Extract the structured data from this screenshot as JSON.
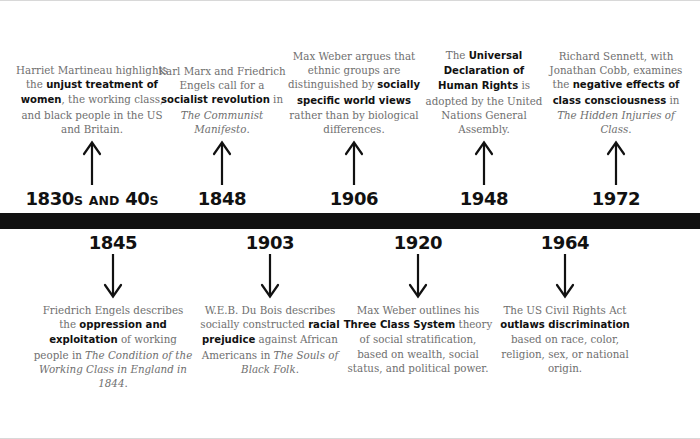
{
  "graphic": {
    "title": "Sociology timeline of class, race and rights",
    "bar_color": "#111111",
    "body_text_color": "#6f6f6f",
    "highlight_text_color": "#111111"
  },
  "top_events": [
    {
      "year": "1830s and 40s",
      "year_main": "1830",
      "arrow": "arrow-up-icon",
      "text_segments": [
        {
          "t": "Harriet Martineau highlights the ",
          "style": "normal"
        },
        {
          "t": "unjust treatment of women",
          "style": "bold"
        },
        {
          "t": ", the working class, and black people in the US and Britain.",
          "style": "normal"
        }
      ]
    },
    {
      "year": "1848",
      "arrow": "arrow-up-icon",
      "text_segments": [
        {
          "t": "Karl Marx and Friedrich Engels call for a ",
          "style": "normal"
        },
        {
          "t": "socialist revolution",
          "style": "bold"
        },
        {
          "t": " in ",
          "style": "normal"
        },
        {
          "t": "The Communist Manifesto",
          "style": "italic"
        },
        {
          "t": ".",
          "style": "normal"
        }
      ]
    },
    {
      "year": "1906",
      "arrow": "arrow-up-icon",
      "text_segments": [
        {
          "t": "Max Weber argues that ethnic groups are distinguished by ",
          "style": "normal"
        },
        {
          "t": "socially specific world views",
          "style": "bold"
        },
        {
          "t": " rather than by biological differences.",
          "style": "normal"
        }
      ]
    },
    {
      "year": "1948",
      "arrow": "arrow-up-icon",
      "text_segments": [
        {
          "t": "The ",
          "style": "normal"
        },
        {
          "t": "Universal Declaration of Human Rights",
          "style": "bold"
        },
        {
          "t": " is adopted by the United Nations General Assembly.",
          "style": "normal"
        }
      ]
    },
    {
      "year": "1972",
      "arrow": "arrow-up-icon",
      "text_segments": [
        {
          "t": "Richard Sennett, with Jonathan Cobb, examines the ",
          "style": "normal"
        },
        {
          "t": "negative effects of class consciousness",
          "style": "bold"
        },
        {
          "t": " in ",
          "style": "normal"
        },
        {
          "t": "The Hidden Injuries of Class",
          "style": "italic"
        },
        {
          "t": ".",
          "style": "normal"
        }
      ]
    }
  ],
  "bottom_events": [
    {
      "year": "1845",
      "arrow": "arrow-down-icon",
      "text_segments": [
        {
          "t": "Friedrich Engels describes the ",
          "style": "normal"
        },
        {
          "t": "oppression and exploitation",
          "style": "bold"
        },
        {
          "t": " of working people in ",
          "style": "normal"
        },
        {
          "t": "The Condition of the Working Class in England in 1844",
          "style": "italic"
        },
        {
          "t": ".",
          "style": "normal"
        }
      ]
    },
    {
      "year": "1903",
      "arrow": "arrow-down-icon",
      "text_segments": [
        {
          "t": "W.E.B. Du Bois describes socially constructed ",
          "style": "normal"
        },
        {
          "t": "racial prejudice",
          "style": "bold"
        },
        {
          "t": " against African Americans in ",
          "style": "normal"
        },
        {
          "t": "The Souls of Black Folk",
          "style": "italic"
        },
        {
          "t": ".",
          "style": "normal"
        }
      ]
    },
    {
      "year": "1920",
      "arrow": "arrow-down-icon",
      "text_segments": [
        {
          "t": "Max Weber outlines his ",
          "style": "normal"
        },
        {
          "t": "Three Class System",
          "style": "bold"
        },
        {
          "t": " theory of social stratification, based on wealth, social status, and political power.",
          "style": "normal"
        }
      ]
    },
    {
      "year": "1964",
      "arrow": "arrow-down-icon",
      "text_segments": [
        {
          "t": "The US Civil Rights Act ",
          "style": "normal"
        },
        {
          "t": "outlaws discrimination",
          "style": "bold"
        },
        {
          "t": " based on race, color, religion, sex, or national origin.",
          "style": "normal"
        }
      ]
    }
  ]
}
